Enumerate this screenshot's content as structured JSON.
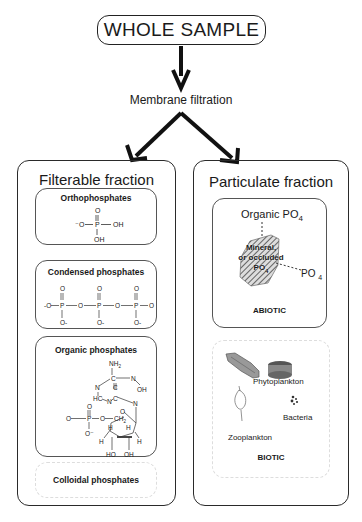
{
  "header": {
    "title": "WHOLE SAMPLE",
    "process": "Membrane filtration"
  },
  "filterable": {
    "title": "Filterable fraction",
    "boxes": [
      {
        "title": "Orthophosphates",
        "structure": {
          "top": "O",
          "left": "-O",
          "center": "P",
          "right": "OH",
          "bottom": "OH"
        }
      },
      {
        "title": "Condensed phosphates",
        "structure": {
          "repeat": 3,
          "center": "P",
          "top": "O",
          "bottom": "O-",
          "bridge": "O",
          "ends": "-O"
        }
      },
      {
        "title": "Organic phosphates",
        "structure": {
          "atoms": [
            "NH2",
            "C",
            "N",
            "C",
            "N",
            "OH",
            "HC",
            "N",
            "C",
            "N",
            "O",
            "P",
            "O",
            "O",
            "CH2",
            "O-",
            "O-",
            "H",
            "H",
            "H",
            "H",
            "HO",
            "OH"
          ]
        }
      },
      {
        "title": "Colloidal phosphates"
      }
    ]
  },
  "particulate": {
    "title": "Particulate fraction",
    "abiotic": {
      "label": "ABIOTIC",
      "organic": "Organic PO",
      "organic_sub": "4",
      "mineral_line1": "Mineral,",
      "mineral_line2": "or occluded",
      "mineral_line3": "PO",
      "mineral_sub": "4",
      "adsorbed": "PO",
      "adsorbed_sub": "4"
    },
    "biotic": {
      "label": "BIOTIC",
      "organisms": [
        "Phytoplankton",
        "Bacteria",
        "Zooplankton"
      ]
    }
  },
  "colors": {
    "line": "#222222",
    "hatch": "#555555",
    "background": "#ffffff"
  }
}
